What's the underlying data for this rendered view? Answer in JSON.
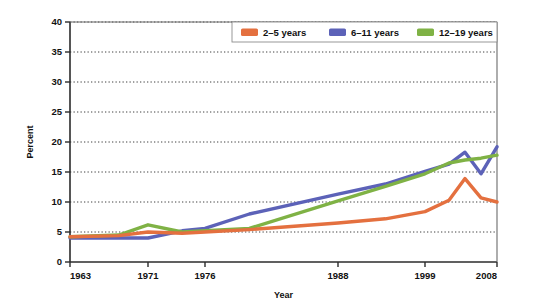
{
  "chart_data": {
    "type": "line",
    "title": "",
    "xlabel": "Year",
    "ylabel": "Percent",
    "ylim": [
      0,
      40
    ],
    "ytick_values": [
      0,
      5,
      10,
      15,
      20,
      25,
      30,
      35,
      40
    ],
    "ytick_labels": [
      "0",
      "5",
      "10",
      "15",
      "20",
      "25",
      "30",
      "35",
      "40"
    ],
    "xlim": [
      1963,
      2008
    ],
    "xtick_values": [
      1963,
      1971,
      1976,
      1988,
      1999,
      2008
    ],
    "xtick_labels": [
      "1963",
      "1971",
      "1976",
      "1988",
      "1999",
      "2008"
    ],
    "grid": "horizontal-dotted",
    "legend_position": "top-right",
    "series": [
      {
        "name": "2–5 years",
        "color": "#E4703F",
        "x": [
          1963,
          1968,
          1971,
          1974,
          1976,
          1980,
          1988,
          1994,
          1999,
          2002,
          2004,
          2006,
          2008
        ],
        "values": [
          4.2,
          4.4,
          5.0,
          4.8,
          5.0,
          5.4,
          6.5,
          7.2,
          8.4,
          10.3,
          13.9,
          10.7,
          10.0
        ]
      },
      {
        "name": "6–11 years",
        "color": "#5C62B8",
        "x": [
          1963,
          1968,
          1971,
          1974,
          1976,
          1980,
          1988,
          1994,
          1999,
          2002,
          2004,
          2006,
          2008
        ],
        "values": [
          4.0,
          4.0,
          4.0,
          5.2,
          5.6,
          8.0,
          11.3,
          13.0,
          15.1,
          16.3,
          18.3,
          14.7,
          19.2
        ]
      },
      {
        "name": "12–19 years",
        "color": "#7FB245",
        "x": [
          1963,
          1968,
          1971,
          1974,
          1976,
          1980,
          1988,
          1994,
          1999,
          2002,
          2004,
          2006,
          2008
        ],
        "values": [
          4.2,
          4.5,
          6.2,
          5.0,
          5.2,
          5.6,
          10.2,
          12.6,
          14.7,
          16.5,
          17.0,
          17.3,
          17.8
        ]
      }
    ]
  },
  "legend": {
    "items": [
      {
        "label": "2–5 years",
        "color": "#E4703F"
      },
      {
        "label": "6–11 years",
        "color": "#5C62B8"
      },
      {
        "label": "12–19 years",
        "color": "#7FB245"
      }
    ]
  },
  "axes": {
    "y_title": "Percent",
    "x_title": "Year"
  }
}
